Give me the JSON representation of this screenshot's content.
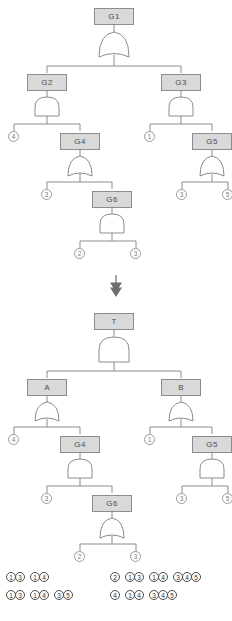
{
  "diagram": {
    "colors": {
      "node_fill": "#d9d9d9",
      "node_border": "#8c8c8c",
      "line": "#7f7f7f",
      "text": "#4d4d4d"
    },
    "transform_arrow": "double-down-arrow"
  },
  "tree_top": {
    "name": "original-fault-tree",
    "nodes": [
      {
        "id": "G1",
        "label": "G1",
        "gate": "OR",
        "children": [
          "G2",
          "G3"
        ]
      },
      {
        "id": "G2",
        "label": "G2",
        "gate": "AND",
        "children": [
          "e4a",
          "G4"
        ]
      },
      {
        "id": "G3",
        "label": "G3",
        "gate": "AND",
        "children": [
          "e1a",
          "G5"
        ]
      },
      {
        "id": "G4",
        "label": "G4",
        "gate": "OR",
        "children": [
          "e3a",
          "G6"
        ]
      },
      {
        "id": "G5",
        "label": "G5",
        "gate": "OR",
        "children": [
          "e3b",
          "e5a"
        ]
      },
      {
        "id": "G6",
        "label": "G6",
        "gate": "AND",
        "children": [
          "e2a",
          "e3c"
        ]
      }
    ],
    "leaves": [
      {
        "id": "e4a",
        "label": "4"
      },
      {
        "id": "e1a",
        "label": "1"
      },
      {
        "id": "e3a",
        "label": "3"
      },
      {
        "id": "e3b",
        "label": "3"
      },
      {
        "id": "e5a",
        "label": "5"
      },
      {
        "id": "e2a",
        "label": "2"
      },
      {
        "id": "e3c",
        "label": "3"
      }
    ]
  },
  "tree_bottom": {
    "name": "transformed-fault-tree",
    "nodes": [
      {
        "id": "T",
        "label": "T",
        "gate": "AND",
        "children": [
          "A",
          "B"
        ]
      },
      {
        "id": "A",
        "label": "A",
        "gate": "OR",
        "children": [
          "f4a",
          "G4"
        ]
      },
      {
        "id": "B",
        "label": "B",
        "gate": "OR",
        "children": [
          "f1a",
          "G5"
        ]
      },
      {
        "id": "G4",
        "label": "G4",
        "gate": "AND",
        "children": [
          "f3a",
          "G6"
        ]
      },
      {
        "id": "G5",
        "label": "G5",
        "gate": "AND",
        "children": [
          "f3b",
          "f5a"
        ]
      },
      {
        "id": "G6",
        "label": "G6",
        "gate": "OR",
        "children": [
          "f2a",
          "f3c"
        ]
      }
    ],
    "leaves": [
      {
        "id": "f4a",
        "label": "4"
      },
      {
        "id": "f1a",
        "label": "1"
      },
      {
        "id": "f3a",
        "label": "3"
      },
      {
        "id": "f3b",
        "label": "3"
      },
      {
        "id": "f5a",
        "label": "5"
      },
      {
        "id": "f2a",
        "label": "2"
      },
      {
        "id": "f3c",
        "label": "3"
      }
    ]
  },
  "cut_sets": {
    "name": "minimal-cut-set-list",
    "rows": [
      {
        "col_left": [
          [
            "1",
            "3"
          ],
          [
            "1",
            "4"
          ]
        ],
        "col_right": [
          [
            "2"
          ],
          [
            "1",
            "3"
          ],
          [
            "1",
            "4"
          ],
          [
            "3",
            "4",
            "5"
          ]
        ]
      },
      {
        "col_left": [
          [
            "1",
            "3"
          ],
          [
            "1",
            "4"
          ],
          [
            "3",
            "5"
          ]
        ],
        "col_right": [
          [
            "4"
          ],
          [
            "1",
            "4"
          ],
          [
            "3",
            "4",
            "5"
          ]
        ]
      }
    ]
  }
}
